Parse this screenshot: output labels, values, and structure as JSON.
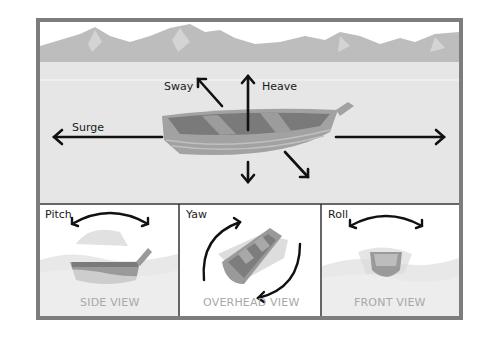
{
  "main": {
    "labels": {
      "sway": "Sway",
      "heave": "Heave",
      "surge": "Surge"
    }
  },
  "panels": [
    {
      "title": "Pitch",
      "view": "SIDE VIEW"
    },
    {
      "title": "Yaw",
      "view": "OVERHEAD VIEW"
    },
    {
      "title": "Roll",
      "view": "FRONT VIEW"
    }
  ],
  "colors": {
    "frame": "#7d7d7d",
    "water": "#e6e6e6",
    "mountains": "#bdbdbd",
    "mountain_highlight": "#d4d4d4",
    "hull": "#9a9a9a",
    "hull_inner": "#7a7a7a",
    "arrow": "#111111",
    "view_label": "#a8a8a8"
  }
}
